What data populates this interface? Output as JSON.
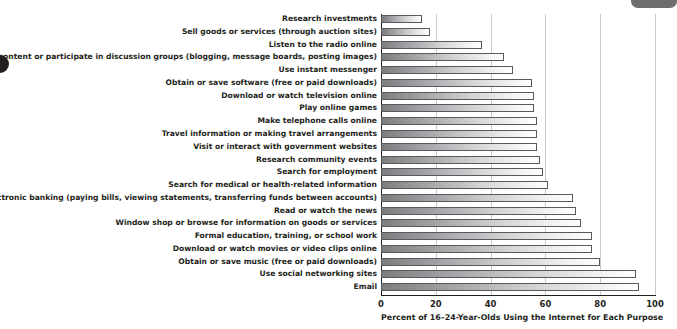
{
  "chart_data": {
    "type": "bar",
    "orientation": "horizontal",
    "title": "",
    "xlabel": "Percent of 16–24-Year-Olds Using the Internet for Each Purpose",
    "ylabel": "",
    "xlim": [
      0,
      100
    ],
    "xticks": [
      0,
      20,
      40,
      60,
      80,
      100
    ],
    "grid": true,
    "legend": null,
    "categories": [
      "Research investments",
      "Sell goods or services (through auction sites)",
      "Listen to the radio online",
      "Contribute content or participate in discussion groups (blogging, message boards, posting images)",
      "Use instant messenger",
      "Obtain or save software (free or paid downloads)",
      "Download or watch television online",
      "Play online games",
      "Make telephone calls online",
      "Travel information or making travel arrangements",
      "Visit or interact with government websites",
      "Research community events",
      "Search for employment",
      "Search for medical or health-related information",
      "Electronic banking (paying bills, viewing statements, transferring funds between accounts)",
      "Read or watch the news",
      "Window shop or browse for information on goods or services",
      "Formal education, training, or school work",
      "Download or watch movies or video clips online",
      "Obtain or save music (free or paid downloads)",
      "Use social networking sites",
      "Email"
    ],
    "values": [
      15,
      18,
      37,
      45,
      48,
      55,
      56,
      56,
      57,
      57,
      57,
      58,
      59,
      61,
      70,
      71,
      73,
      77,
      77,
      80,
      93,
      94
    ]
  },
  "artifacts": {
    "left_dot": "page-edge-dot",
    "corner_tab": "page-corner-tab"
  }
}
